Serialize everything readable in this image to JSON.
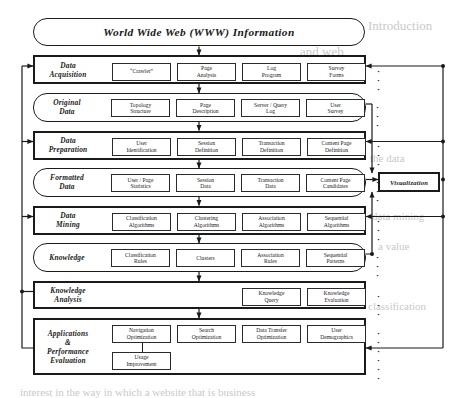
{
  "figure": {
    "title": "World Wide Web (WWW) Information",
    "visualization_label": "Visualization",
    "ellipsis": "· · ·"
  },
  "rows": [
    {
      "stage": "Data\nAcquisition",
      "kind": "process",
      "cells": [
        {
          "label": "“Crawler”",
          "emphasis": false
        },
        {
          "label": "Page\nAnalysis",
          "emphasis": false
        },
        {
          "label": "Log\nProgram",
          "emphasis": false
        },
        {
          "label": "Survey\nForms",
          "emphasis": false
        }
      ]
    },
    {
      "stage": "Original\nData",
      "kind": "data",
      "cells": [
        {
          "label": "Topology\nStructure",
          "emphasis": true
        },
        {
          "label": "Page\nDescription",
          "emphasis": false
        },
        {
          "label": "Server / Query\nLog",
          "emphasis": true
        },
        {
          "label": "User\nSurvey",
          "emphasis": false
        }
      ]
    },
    {
      "stage": "Data\nPreparation",
      "kind": "process",
      "cells": [
        {
          "label": "User\nIdentification",
          "emphasis": false
        },
        {
          "label": "Session\nDefinition",
          "emphasis": false
        },
        {
          "label": "Transaction\nDefinition",
          "emphasis": false
        },
        {
          "label": "Content Page\nDefinition",
          "emphasis": false
        }
      ]
    },
    {
      "stage": "Formatted\nData",
      "kind": "data",
      "cells": [
        {
          "label": "User / Page\nStatistics",
          "emphasis": false
        },
        {
          "label": "Session\nData",
          "emphasis": false
        },
        {
          "label": "Transaction\nData",
          "emphasis": false
        },
        {
          "label": "Content Page\nCandidates",
          "emphasis": false
        }
      ]
    },
    {
      "stage": "Data\nMining",
      "kind": "process",
      "cells": [
        {
          "label": "Classification\nAlgorithms",
          "emphasis": false
        },
        {
          "label": "Clustering\nAlgorithms",
          "emphasis": false
        },
        {
          "label": "Association\nAlgorithms",
          "emphasis": false
        },
        {
          "label": "Sequential\nAlgorithms",
          "emphasis": false
        }
      ]
    },
    {
      "stage": "Knowledge",
      "kind": "data",
      "cells": [
        {
          "label": "Classification\nRules",
          "emphasis": false
        },
        {
          "label": "Clusters",
          "emphasis": false
        },
        {
          "label": "Association\nRules",
          "emphasis": false
        },
        {
          "label": "Sequential\nPatterns",
          "emphasis": false
        }
      ]
    },
    {
      "stage": "Knowledge\nAnalysis",
      "kind": "process",
      "cells": [
        {
          "label": "",
          "emphasis": false
        },
        {
          "label": "",
          "emphasis": false
        },
        {
          "label": "Knowledge\nQuery",
          "emphasis": false
        },
        {
          "label": "Knowledge\nEvaluation",
          "emphasis": false
        }
      ]
    },
    {
      "stage": "Applications\n&\nPerformance\nEvaluation",
      "kind": "process",
      "cells": [
        {
          "label": "Navigation\nOptimization",
          "emphasis": true
        },
        {
          "label": "Search\nOptimization",
          "emphasis": false
        },
        {
          "label": "Data Transfer\nOptimization",
          "emphasis": false
        },
        {
          "label": "User\nDemographics",
          "emphasis": false
        }
      ],
      "extra_cells": [
        {
          "label": "Usage\nImprovement",
          "emphasis": true
        }
      ]
    }
  ],
  "ghost_text": [
    {
      "text": "Introduction",
      "x": 368,
      "y": 18,
      "size": 13
    },
    {
      "text": "and web",
      "x": 300,
      "y": 44,
      "size": 13
    },
    {
      "text": "the data",
      "x": 370,
      "y": 152,
      "size": 11
    },
    {
      "text": "data mining",
      "x": 372,
      "y": 210,
      "size": 11
    },
    {
      "text": "a value",
      "x": 378,
      "y": 240,
      "size": 11
    },
    {
      "text": "classification",
      "x": 368,
      "y": 300,
      "size": 11
    },
    {
      "text": "so that",
      "x": 300,
      "y": 356,
      "size": 12
    },
    {
      "text": "shaped and its abstract",
      "x": 205,
      "y": 356,
      "size": 12
    },
    {
      "text": "interest in the way in which a website that is business",
      "x": 20,
      "y": 386,
      "size": 11
    }
  ]
}
